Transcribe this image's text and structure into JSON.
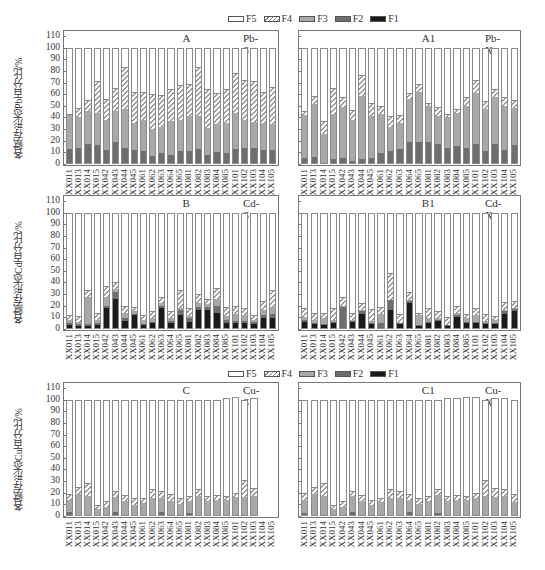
{
  "legend": {
    "items": [
      {
        "key": "F5",
        "label": "F5",
        "style": "white"
      },
      {
        "key": "F4",
        "label": "F4",
        "style": "hatched"
      },
      {
        "key": "F3",
        "label": "F3",
        "color": "#a9a9a9"
      },
      {
        "key": "F2",
        "label": "F2",
        "color": "#6e6e6e"
      },
      {
        "key": "F1",
        "label": "F1",
        "color": "#1a1a1a"
      }
    ]
  },
  "samples": [
    "XX011",
    "XX013",
    "XX014",
    "XX015",
    "XX042",
    "XX043",
    "XX044",
    "XX045",
    "XX061",
    "XX062",
    "XX063",
    "XX064",
    "XX065",
    "XX081",
    "XX082",
    "XX083",
    "XX084",
    "XX085",
    "XX101",
    "XX102",
    "XX103",
    "XX104",
    "XX105"
  ],
  "y_ticks": [
    "0",
    "10",
    "20",
    "30",
    "40",
    "50",
    "60",
    "70",
    "80",
    "90",
    "100",
    "110"
  ],
  "panels": [
    {
      "id": "A",
      "label": "A",
      "tag": "Pb-S",
      "ylabel": "各赋存形态Pb百分比/%"
    },
    {
      "id": "A1",
      "label": "A1",
      "tag": "Pb-X",
      "ylabel": ""
    },
    {
      "id": "B",
      "label": "B",
      "tag": "Cd-S",
      "ylabel": "各赋存形态Cd百分比/%"
    },
    {
      "id": "B1",
      "label": "B1",
      "tag": "Cd-X",
      "ylabel": ""
    },
    {
      "id": "C",
      "label": "C",
      "tag": "Cu-S",
      "ylabel": "各赋存形态Cu百分比/%"
    },
    {
      "id": "C1",
      "label": "C1",
      "tag": "Cu-X",
      "ylabel": ""
    }
  ],
  "chart_data": [
    {
      "type": "bar",
      "stacked": true,
      "title": "A",
      "subtitle": "Pb-S",
      "xlabel": "",
      "ylabel": "各赋存形态Pb百分比/%",
      "ylim": [
        0,
        110
      ],
      "categories": [
        "XX011",
        "XX013",
        "XX014",
        "XX015",
        "XX042",
        "XX043",
        "XX044",
        "XX045",
        "XX061",
        "XX062",
        "XX063",
        "XX064",
        "XX065",
        "XX081",
        "XX082",
        "XX083",
        "XX084",
        "XX085",
        "XX101",
        "XX102",
        "XX103",
        "XX104",
        "XX105"
      ],
      "legend": [
        "F5",
        "F4",
        "F3",
        "F2",
        "F1"
      ],
      "cumulative_tops": {
        "F1": [
          0,
          0,
          0,
          0,
          0,
          0,
          0,
          0,
          0,
          0,
          0,
          0,
          0,
          0,
          0,
          0,
          0,
          0,
          0,
          0,
          0,
          0,
          0
        ],
        "F2": [
          14,
          15,
          18,
          17,
          13,
          20,
          15,
          13,
          12,
          8,
          10,
          9,
          12,
          12,
          14,
          9,
          11,
          10,
          14,
          15,
          15,
          13,
          13
        ],
        "F3": [
          43,
          41,
          46,
          45,
          39,
          46,
          48,
          36,
          39,
          31,
          33,
          38,
          39,
          42,
          42,
          32,
          35,
          36,
          45,
          39,
          37,
          36,
          35
        ],
        "F4": [
          44,
          49,
          56,
          72,
          57,
          66,
          84,
          63,
          63,
          61,
          60,
          65,
          69,
          70,
          84,
          65,
          62,
          65,
          79,
          73,
          72,
          63,
          67
        ],
        "F5": [
          100,
          100,
          100,
          100,
          100,
          100,
          100,
          100,
          100,
          100,
          100,
          100,
          100,
          100,
          100,
          100,
          100,
          100,
          100,
          100,
          100,
          100,
          100
        ]
      }
    },
    {
      "type": "bar",
      "stacked": true,
      "title": "A1",
      "subtitle": "Pb-X",
      "xlabel": "",
      "ylabel": "",
      "ylim": [
        0,
        110
      ],
      "categories": [
        "XX011",
        "XX013",
        "XX014",
        "XX015",
        "XX042",
        "XX043",
        "XX044",
        "XX045",
        "XX061",
        "XX062",
        "XX063",
        "XX064",
        "XX065",
        "XX081",
        "XX082",
        "XX083",
        "XX084",
        "XX085",
        "XX101",
        "XX102",
        "XX103",
        "XX104",
        "XX105"
      ],
      "legend": [
        "F5",
        "F4",
        "F3",
        "F2",
        "F1"
      ],
      "cumulative_tops": {
        "F1": [
          0,
          0,
          0,
          0,
          0,
          0,
          0,
          0,
          0,
          0,
          0,
          0,
          0,
          0,
          0,
          0,
          0,
          0,
          0,
          0,
          0,
          0,
          0
        ],
        "F2": [
          6,
          7,
          1,
          5,
          6,
          3,
          5,
          6,
          10,
          12,
          14,
          20,
          20,
          20,
          18,
          15,
          16,
          15,
          18,
          12,
          18,
          13,
          17
        ],
        "F3": [
          43,
          52,
          27,
          44,
          50,
          39,
          59,
          42,
          44,
          33,
          36,
          57,
          63,
          51,
          42,
          41,
          45,
          51,
          62,
          48,
          58,
          51,
          49
        ],
        "F4": [
          46,
          59,
          38,
          66,
          58,
          47,
          77,
          53,
          51,
          42,
          43,
          62,
          70,
          53,
          50,
          44,
          48,
          58,
          73,
          55,
          65,
          58,
          56
        ],
        "F5": [
          100,
          100,
          100,
          100,
          100,
          100,
          100,
          100,
          100,
          100,
          100,
          100,
          100,
          100,
          100,
          100,
          100,
          100,
          100,
          100,
          100,
          100,
          100
        ]
      }
    },
    {
      "type": "bar",
      "stacked": true,
      "title": "B",
      "subtitle": "Cd-S",
      "xlabel": "",
      "ylabel": "各赋存形态Cd百分比/%",
      "ylim": [
        0,
        110
      ],
      "categories": [
        "XX011",
        "XX013",
        "XX014",
        "XX015",
        "XX042",
        "XX043",
        "XX044",
        "XX045",
        "XX061",
        "XX062",
        "XX063",
        "XX064",
        "XX065",
        "XX081",
        "XX082",
        "XX083",
        "XX084",
        "XX085",
        "XX101",
        "XX102",
        "XX103",
        "XX104",
        "XX105"
      ],
      "legend": [
        "F5",
        "F4",
        "F3",
        "F2",
        "F1"
      ],
      "cumulative_tops": {
        "F1": [
          4,
          3,
          3,
          4,
          19,
          27,
          8,
          13,
          4,
          6,
          19,
          6,
          13,
          7,
          17,
          17,
          15,
          6,
          6,
          6,
          5,
          10,
          10
        ],
        "F2": [
          6,
          5,
          5,
          6,
          21,
          33,
          10,
          14,
          5,
          7,
          21,
          8,
          17,
          10,
          20,
          20,
          21,
          9,
          8,
          8,
          7,
          13,
          14
        ],
        "F3": [
          9,
          7,
          28,
          9,
          28,
          35,
          15,
          16,
          9,
          10,
          23,
          10,
          19,
          12,
          23,
          22,
          27,
          12,
          14,
          13,
          9,
          17,
          20
        ],
        "F4": [
          13,
          12,
          34,
          15,
          38,
          41,
          21,
          20,
          13,
          16,
          28,
          16,
          34,
          19,
          31,
          27,
          36,
          20,
          21,
          19,
          13,
          25,
          34
        ],
        "F5": [
          100,
          100,
          100,
          100,
          100,
          100,
          100,
          100,
          100,
          100,
          100,
          100,
          100,
          100,
          100,
          100,
          100,
          100,
          100,
          100,
          100,
          100,
          100
        ]
      }
    },
    {
      "type": "bar",
      "stacked": true,
      "title": "B1",
      "subtitle": "Cd-X",
      "xlabel": "",
      "ylabel": "",
      "ylim": [
        0,
        110
      ],
      "categories": [
        "XX011",
        "XX013",
        "XX014",
        "XX015",
        "XX042",
        "XX043",
        "XX044",
        "XX045",
        "XX061",
        "XX062",
        "XX063",
        "XX064",
        "XX065",
        "XX081",
        "XX082",
        "XX083",
        "XX084",
        "XX085",
        "XX101",
        "XX102",
        "XX103",
        "XX104",
        "XX105"
      ],
      "legend": [
        "F5",
        "F4",
        "F3",
        "F2",
        "F1"
      ],
      "cumulative_tops": {
        "F1": [
          7,
          5,
          4,
          6,
          2,
          7,
          14,
          5,
          0,
          17,
          5,
          23,
          3,
          6,
          8,
          3,
          11,
          6,
          6,
          5,
          5,
          14,
          16
        ],
        "F2": [
          9,
          6,
          5,
          7,
          20,
          8,
          16,
          6,
          6,
          26,
          6,
          25,
          4,
          7,
          9,
          4,
          13,
          7,
          7,
          6,
          6,
          16,
          18
        ],
        "F3": [
          11,
          9,
          10,
          9,
          21,
          9,
          17,
          8,
          14,
          26,
          6,
          26,
          13,
          10,
          10,
          4,
          15,
          10,
          13,
          8,
          9,
          17,
          19
        ],
        "F4": [
          19,
          15,
          15,
          19,
          28,
          15,
          23,
          18,
          20,
          49,
          14,
          33,
          15,
          19,
          16,
          11,
          21,
          14,
          19,
          14,
          12,
          24,
          25
        ],
        "F5": [
          100,
          100,
          100,
          100,
          100,
          100,
          100,
          100,
          100,
          100,
          100,
          100,
          100,
          100,
          100,
          100,
          100,
          100,
          100,
          100,
          100,
          100,
          100
        ]
      }
    },
    {
      "type": "bar",
      "stacked": true,
      "title": "C",
      "subtitle": "Cu-S",
      "xlabel": "",
      "ylabel": "各赋存形态Cu百分比/%",
      "ylim": [
        0,
        110
      ],
      "categories": [
        "XX011",
        "XX013",
        "XX014",
        "XX015",
        "XX042",
        "XX043",
        "XX044",
        "XX045",
        "XX061",
        "XX062",
        "XX063",
        "XX064",
        "XX065",
        "XX081",
        "XX082",
        "XX083",
        "XX084",
        "XX085",
        "XX101",
        "XX102",
        "XX103",
        "XX104",
        "XX105"
      ],
      "legend": [
        "F5",
        "F4",
        "F3",
        "F2",
        "F1"
      ],
      "cumulative_tops": {
        "F1": [
          1,
          1,
          1,
          0,
          0,
          1,
          1,
          1,
          1,
          1,
          1,
          0,
          0,
          1,
          1,
          1,
          1,
          1,
          1,
          1,
          1,
          0,
          0
        ],
        "F2": [
          4,
          2,
          2,
          1,
          1,
          4,
          2,
          2,
          2,
          2,
          4,
          1,
          1,
          3,
          2,
          2,
          2,
          2,
          2,
          2,
          2,
          0,
          0
        ],
        "F3": [
          15,
          20,
          18,
          7,
          9,
          17,
          14,
          10,
          12,
          16,
          16,
          14,
          11,
          14,
          18,
          14,
          15,
          15,
          17,
          17,
          18,
          0,
          0
        ],
        "F4": [
          20,
          26,
          29,
          10,
          14,
          22,
          19,
          16,
          16,
          24,
          22,
          20,
          16,
          18,
          24,
          18,
          19,
          18,
          21,
          32,
          25,
          0,
          0
        ],
        "F5": [
          100,
          100,
          100,
          100,
          100,
          100,
          100,
          100,
          100,
          100,
          100,
          100,
          100,
          100,
          100,
          100,
          100,
          101,
          102,
          100,
          101,
          0,
          0
        ]
      }
    },
    {
      "type": "bar",
      "stacked": true,
      "title": "C1",
      "subtitle": "Cu-X",
      "xlabel": "",
      "ylabel": "",
      "ylim": [
        0,
        110
      ],
      "categories": [
        "XX011",
        "XX013",
        "XX014",
        "XX015",
        "XX042",
        "XX043",
        "XX044",
        "XX045",
        "XX061",
        "XX062",
        "XX063",
        "XX064",
        "XX065",
        "XX081",
        "XX082",
        "XX083",
        "XX084",
        "XX085",
        "XX101",
        "XX102",
        "XX103",
        "XX104",
        "XX105"
      ],
      "legend": [
        "F5",
        "F4",
        "F3",
        "F2",
        "F1"
      ],
      "cumulative_tops": {
        "F1": [
          1,
          1,
          1,
          0,
          1,
          1,
          1,
          0,
          1,
          1,
          1,
          1,
          1,
          1,
          1,
          1,
          1,
          1,
          1,
          1,
          1,
          1,
          1
        ],
        "F2": [
          3,
          2,
          2,
          1,
          2,
          4,
          2,
          1,
          2,
          2,
          2,
          4,
          2,
          2,
          3,
          2,
          2,
          2,
          2,
          2,
          2,
          2,
          2
        ],
        "F3": [
          15,
          20,
          18,
          7,
          9,
          18,
          14,
          10,
          13,
          16,
          16,
          15,
          11,
          14,
          19,
          14,
          15,
          15,
          16,
          18,
          17,
          18,
          13
        ],
        "F4": [
          21,
          26,
          29,
          10,
          14,
          22,
          19,
          15,
          16,
          24,
          22,
          20,
          16,
          18,
          24,
          18,
          19,
          18,
          21,
          32,
          25,
          24,
          20
        ],
        "F5": [
          100,
          100,
          100,
          100,
          100,
          100,
          100,
          100,
          100,
          100,
          100,
          100,
          100,
          100,
          100,
          101,
          101,
          102,
          102,
          100,
          101,
          101,
          100
        ]
      }
    }
  ]
}
